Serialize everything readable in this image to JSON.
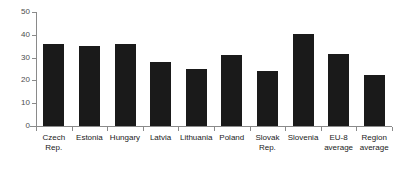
{
  "chart_data": {
    "type": "bar",
    "title": "",
    "subtitle": "",
    "xlabel": "",
    "ylabel": "",
    "ylim": [
      0,
      50
    ],
    "yticks": [
      0,
      10,
      20,
      30,
      40,
      50
    ],
    "grid": false,
    "legend": false,
    "legend_position": "none",
    "bar_color": "#1a1a1a",
    "axis_color": "#8a8a8a",
    "categories": [
      "Czech\nRep.",
      "Estonia",
      "Hungary",
      "Latvia",
      "Lithuania",
      "Poland",
      "Slovak\nRep.",
      "Slovenia",
      "EU-8\naverage",
      "Region\naverage"
    ],
    "values": [
      36,
      35,
      36,
      28,
      25,
      31,
      24,
      40.5,
      31.5,
      22.5
    ]
  }
}
